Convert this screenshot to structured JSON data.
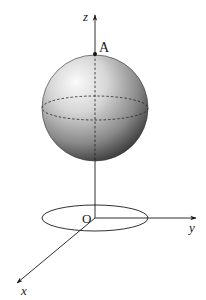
{
  "diagram": {
    "type": "3d-coordinate-sphere",
    "labels": {
      "z_axis": "z",
      "y_axis": "y",
      "x_axis": "x",
      "origin": "O",
      "point_a": "A"
    },
    "sphere": {
      "center": [
        95,
        108
      ],
      "radius": 53,
      "equator_ry": 12
    },
    "base_ellipse": {
      "center": [
        95,
        218
      ],
      "rx": 53,
      "ry": 13
    },
    "colors": {
      "stroke": "#1a1a1a",
      "sphere_light": "#f2f2f2",
      "sphere_dark": "#2a2a2a"
    }
  }
}
